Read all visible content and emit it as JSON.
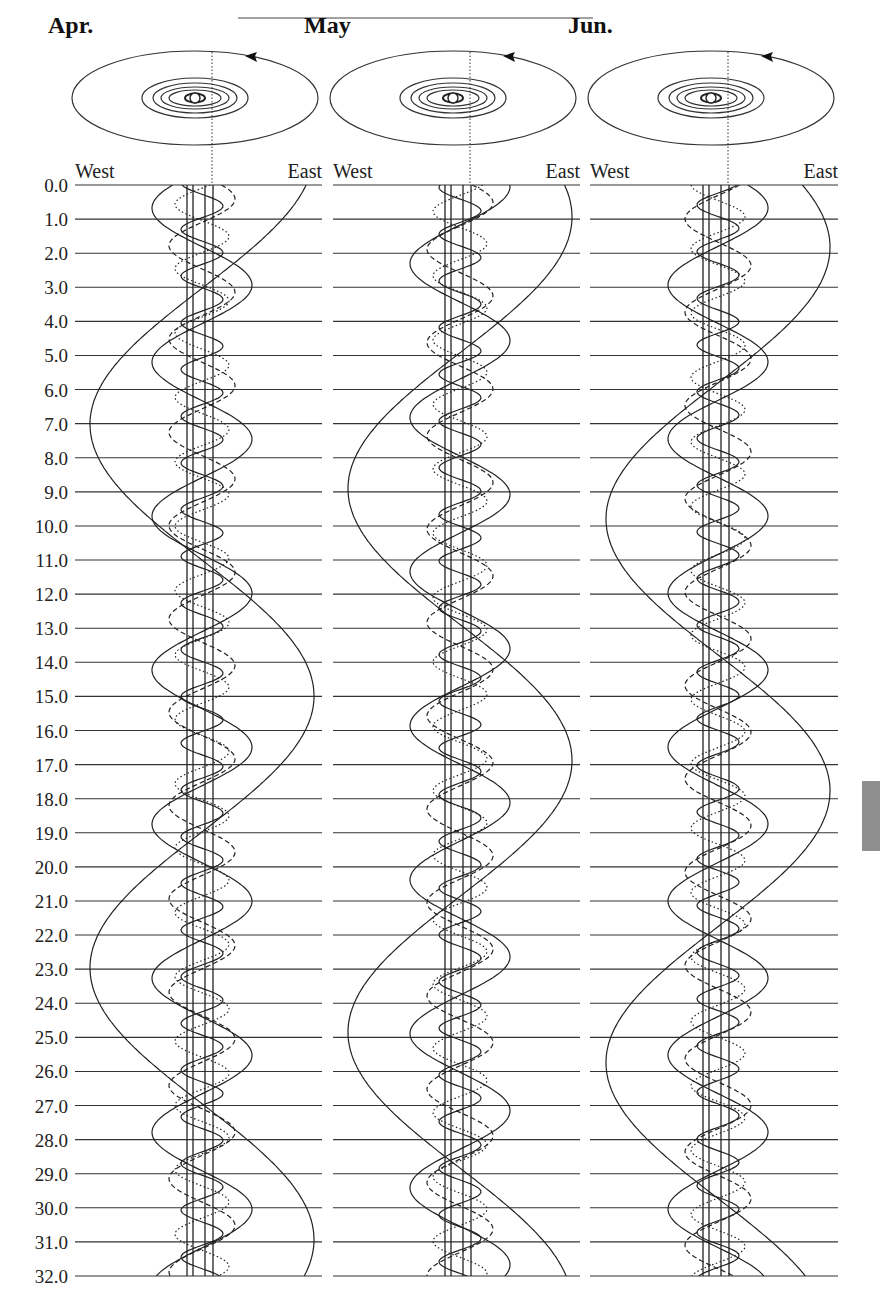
{
  "chart_data": {
    "type": "line",
    "xlabel_left": "West",
    "xlabel_right": "East",
    "ylabel": "Day of month",
    "y_ticks": [
      "0.0",
      "1.0",
      "2.0",
      "3.0",
      "4.0",
      "5.0",
      "6.0",
      "7.0",
      "8.0",
      "9.0",
      "10.0",
      "11.0",
      "12.0",
      "13.0",
      "14.0",
      "15.0",
      "16.0",
      "17.0",
      "18.0",
      "19.0",
      "20.0",
      "21.0",
      "22.0",
      "23.0",
      "24.0",
      "25.0",
      "26.0",
      "27.0",
      "28.0",
      "29.0",
      "30.0",
      "31.0",
      "32.0"
    ],
    "ylim": [
      0,
      32
    ],
    "grid": "horizontal lines at each whole day",
    "panels": [
      {
        "month": "Apr.",
        "center_x": 212,
        "phase_offset_days": 0
      },
      {
        "month": "May",
        "center_x": 470,
        "phase_offset_days": 30
      },
      {
        "month": "Jun.",
        "center_x": 728,
        "phase_offset_days": 61
      }
    ],
    "series": [
      {
        "name": "Titan",
        "style": "solid",
        "period_days": 15.945,
        "amplitude_px": 112,
        "phase": 0.31
      },
      {
        "name": "Rhea",
        "style": "solid",
        "period_days": 4.518,
        "amplitude_px": 50,
        "phase": 0.6
      },
      {
        "name": "Dione",
        "style": "dashed",
        "period_days": 2.737,
        "amplitude_px": 33,
        "phase": 0.1
      },
      {
        "name": "Tethys",
        "style": "dotted",
        "period_days": 1.888,
        "amplitude_px": 27,
        "phase": 0.45
      },
      {
        "name": "Enceladus",
        "style": "solid",
        "period_days": 1.37,
        "amplitude_px": 21,
        "phase": 0.8
      }
    ],
    "disk_lines_offsets_px": [
      -25,
      -19,
      -7,
      1
    ],
    "orbit_diagram": {
      "arrow_direction": "counter-clockwise (east to west on far side)",
      "rings": 5
    }
  },
  "labels": {
    "west": "West",
    "east": "East"
  },
  "months": [
    "Apr.",
    "May",
    "Jun."
  ]
}
